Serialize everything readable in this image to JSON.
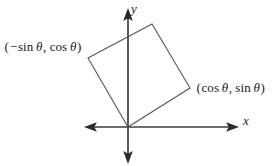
{
  "figure": {
    "background_color": "#ffffff",
    "axis_color": "#3c3c3c",
    "square_color": "#55555a",
    "text_color": "#1a1a1a",
    "axes": {
      "x_label": "x",
      "y_label": "y",
      "origin": {
        "x": 128,
        "y": 127
      },
      "x_axis": {
        "x_start": 85,
        "x_end": 238,
        "y": 127
      },
      "y_axis": {
        "x": 128,
        "y_start": 10,
        "y_end": 162
      }
    },
    "labels": {
      "vertex_left": {
        "text": "(− sin θ, cos θ)",
        "open_paren": "(",
        "minus": "−",
        "fn1": "sin",
        "theta1": "θ",
        "comma": ",",
        "fn2": "cos",
        "theta2": "θ",
        "close_paren": ")"
      },
      "vertex_right": {
        "text": "(cos θ, sin θ)",
        "open_paren": "(",
        "fn1": "cos",
        "theta1": "θ",
        "comma": ",",
        "fn2": "sin",
        "theta2": "θ",
        "close_paren": ")"
      }
    },
    "square": {
      "description": "unit square rotated by theta about the origin",
      "vertices": [
        {
          "name": "origin",
          "x": 128,
          "y": 127
        },
        {
          "name": "cos-sin-vertex",
          "x": 190,
          "y": 88
        },
        {
          "name": "top-vertex",
          "x": 152,
          "y": 24
        },
        {
          "name": "minus-sin-cos-vertex",
          "x": 88,
          "y": 58
        }
      ],
      "points_attr": "128,127 190,88 152,24 88,58"
    }
  },
  "chart_data": {
    "type": "scatter",
    "xlabel": "x",
    "ylabel": "y",
    "grid": false,
    "legend": "none",
    "xlim": [
      -1.5,
      1.8
    ],
    "ylim": [
      -0.6,
      1.9
    ],
    "annotations": [
      {
        "text": "(− sin θ, cos θ)",
        "x": -0.65,
        "y": 1.18
      },
      {
        "text": "(cos θ, sin θ)",
        "x": 1.0,
        "y": 0.63
      }
    ],
    "series": [
      {
        "name": "rotated unit square",
        "closed": true,
        "points": [
          {
            "label": "(0, 0)",
            "x": 0.0,
            "y": 0.0
          },
          {
            "label": "(cos θ, sin θ)",
            "x": 0.85,
            "y": 0.53
          },
          {
            "label": "(cos θ − sin θ, sin θ + cos θ)",
            "x": 0.33,
            "y": 1.41
          },
          {
            "label": "(− sin θ, cos θ)",
            "x": -0.53,
            "y": 0.85
          }
        ]
      }
    ]
  }
}
